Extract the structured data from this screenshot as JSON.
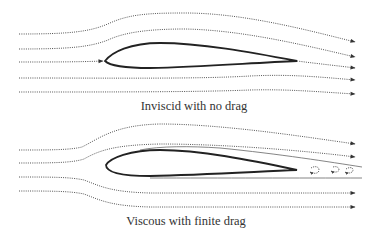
{
  "diagrams": [
    {
      "id": "inviscid",
      "caption": "Inviscid with no drag",
      "description": "Streamlines around an airfoil in inviscid flow; flow rejoins smoothly at trailing edge, no wake"
    },
    {
      "id": "viscous",
      "caption": "Viscous with finite drag",
      "description": "Streamlines around an airfoil in viscous flow; boundary layer and wake with shed vortices behind trailing edge"
    }
  ],
  "colors": {
    "background": "#ffffff",
    "streamline": "#555555",
    "airfoil": "#222222",
    "text": "#333333"
  }
}
